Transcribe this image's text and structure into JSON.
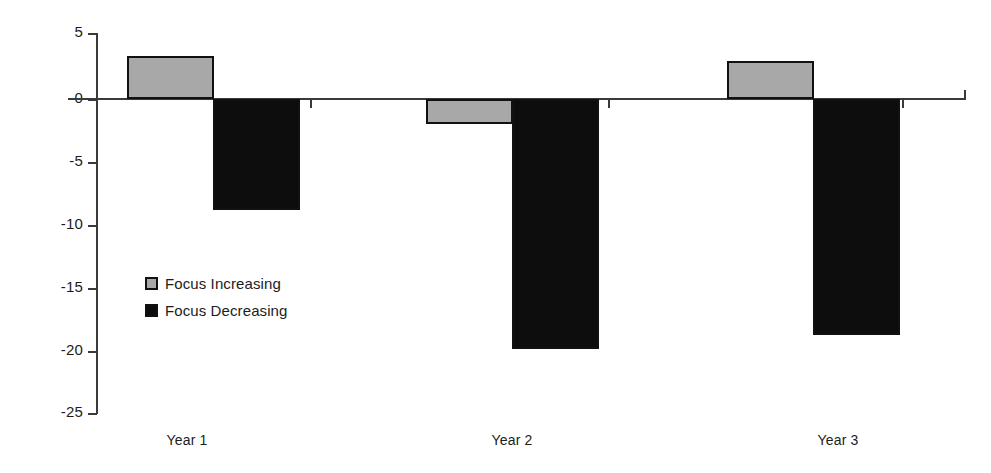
{
  "chart_data": {
    "type": "bar",
    "title": "",
    "subtitle": "",
    "xlabel": "",
    "ylabel": "",
    "categories": [
      "Year 1",
      "Year 2",
      "Year 3"
    ],
    "series": [
      {
        "name": "Focus Increasing",
        "color": "#a8a8a8",
        "values": [
          3.4,
          -2.0,
          3.0
        ]
      },
      {
        "name": "Focus Decreasing",
        "color": "#0d0d0d",
        "values": [
          -8.8,
          -19.7,
          -18.6
        ]
      }
    ],
    "ylim": [
      -25,
      5
    ],
    "yticks": [
      5,
      0,
      -5,
      -10,
      -15,
      -20,
      -25
    ],
    "ytick_labels": [
      "5",
      "0",
      "-5",
      "-10",
      "-15",
      "-20",
      "-25"
    ],
    "grid": false,
    "legend_position": "inside-left",
    "zero_line": true
  },
  "legend": {
    "items": [
      {
        "label": "Focus Increasing",
        "swatch": "increasing"
      },
      {
        "label": "Focus Decreasing",
        "swatch": "decreasing"
      }
    ]
  },
  "axis": {
    "y_labels": [
      "5",
      "0",
      "-5",
      "-10",
      "-15",
      "-20",
      "-25"
    ],
    "x_labels": [
      "Year 1",
      "Year 2",
      "Year 3"
    ]
  },
  "geometry": {
    "zero_y": 99,
    "px_per_unit": 12.6667,
    "groups": [
      {
        "increasing_x": 127,
        "decreasing_x": 213,
        "label_x": 187
      },
      {
        "increasing_x": 426,
        "decreasing_x": 512,
        "label_x": 512
      },
      {
        "increasing_x": 727,
        "decreasing_x": 813,
        "label_x": 838
      }
    ],
    "bar_width": 87,
    "y_tick_ys": [
      33,
      99,
      162,
      225,
      288,
      351,
      413
    ]
  }
}
